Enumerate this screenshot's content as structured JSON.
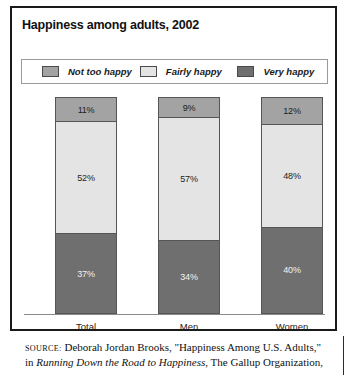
{
  "figure": {
    "title": "Happiness among adults, 2002"
  },
  "legend": {
    "items": [
      {
        "label": "Not too happy",
        "color": "#a3a3a3"
      },
      {
        "label": "Fairly happy",
        "color": "#e4e4e4"
      },
      {
        "label": "Very happy",
        "color": "#6f6f6f"
      }
    ]
  },
  "source": {
    "tag": "SOURCE:",
    "line1": " Deborah Jordan Brooks, \"Happiness Among U.S. Adults,\" in",
    "line2_italic": "Running Down the Road to Happiness",
    "line2_rest": ", The Gallup Organization,"
  },
  "chart_data": {
    "type": "bar",
    "subtype": "stacked-100-percent",
    "title": "Happiness among adults, 2002",
    "xlabel": "",
    "ylabel": "",
    "ylim": [
      0,
      100
    ],
    "grid": false,
    "legend_position": "top",
    "categories": [
      "Total",
      "Men",
      "Women"
    ],
    "series": [
      {
        "name": "Very happy",
        "color": "#6f6f6f",
        "values": [
          37,
          34,
          40
        ],
        "labels": [
          "37%",
          "34%",
          "40%"
        ]
      },
      {
        "name": "Fairly happy",
        "color": "#e4e4e4",
        "values": [
          52,
          57,
          48
        ],
        "labels": [
          "52%",
          "57%",
          "48%"
        ]
      },
      {
        "name": "Not too happy",
        "color": "#a3a3a3",
        "values": [
          11,
          9,
          12
        ],
        "labels": [
          "11%",
          "9%",
          "12%"
        ]
      }
    ],
    "bars": [
      {
        "category": "Total",
        "segments": [
          {
            "name": "Not too happy",
            "value": 11,
            "label": "11%",
            "color": "#a3a3a3"
          },
          {
            "name": "Fairly happy",
            "value": 52,
            "label": "52%",
            "color": "#e4e4e4"
          },
          {
            "name": "Very happy",
            "value": 37,
            "label": "37%",
            "color": "#6f6f6f"
          }
        ]
      },
      {
        "category": "Men",
        "segments": [
          {
            "name": "Not too happy",
            "value": 9,
            "label": "9%",
            "color": "#a3a3a3"
          },
          {
            "name": "Fairly happy",
            "value": 57,
            "label": "57%",
            "color": "#e4e4e4"
          },
          {
            "name": "Very happy",
            "value": 34,
            "label": "34%",
            "color": "#6f6f6f"
          }
        ]
      },
      {
        "category": "Women",
        "segments": [
          {
            "name": "Not too happy",
            "value": 12,
            "label": "12%",
            "color": "#a3a3a3"
          },
          {
            "name": "Fairly happy",
            "value": 48,
            "label": "48%",
            "color": "#e4e4e4"
          },
          {
            "name": "Very happy",
            "value": 40,
            "label": "40%",
            "color": "#6f6f6f"
          }
        ]
      }
    ]
  }
}
